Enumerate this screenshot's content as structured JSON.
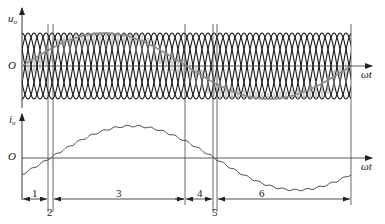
{
  "diagram": {
    "type": "cycloconverter output voltage and current waveforms",
    "top_plot": {
      "y_axis_label": "u",
      "y_axis_subscript": "o",
      "origin_label": "O",
      "x_axis_label": "ωt",
      "carrier_color": "#1a1a1a",
      "fundamental_color": "#8a8a8a"
    },
    "bottom_plot": {
      "y_axis_label": "i",
      "y_axis_subscript": "o",
      "origin_label": "O",
      "x_axis_label": "ωt",
      "curve_color": "#555555"
    },
    "intervals": [
      {
        "label": "1"
      },
      {
        "label": "2"
      },
      {
        "label": "3"
      },
      {
        "label": "4"
      },
      {
        "label": "5"
      },
      {
        "label": "6"
      }
    ],
    "colors": {
      "axis": "#333333",
      "divider": "#444444",
      "background": "#ffffff"
    }
  }
}
